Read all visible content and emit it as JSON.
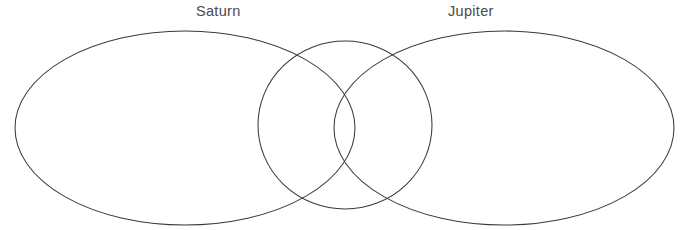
{
  "diagram": {
    "type": "venn",
    "title": "",
    "background_color": "#ffffff",
    "stroke_color": "#3a3a3a",
    "label_color": "#4a4a4a",
    "sets": [
      {
        "id": "left",
        "label": "Saturn",
        "shape": "ellipse",
        "cx": 185,
        "cy": 128,
        "rx": 170,
        "ry": 97
      },
      {
        "id": "right",
        "label": "Jupiter",
        "shape": "ellipse",
        "cx": 504,
        "cy": 128,
        "rx": 170,
        "ry": 97
      },
      {
        "id": "middle",
        "label": "",
        "shape": "ellipse",
        "cx": 345,
        "cy": 125,
        "rx": 87,
        "ry": 84
      }
    ],
    "intersection_points": [
      {
        "x": 345,
        "y": 33
      },
      {
        "x": 345,
        "y": 222
      }
    ],
    "region_labels": [],
    "clipped_text": "",
    "labels": {
      "left": "Saturn",
      "right": "Jupiter"
    }
  }
}
